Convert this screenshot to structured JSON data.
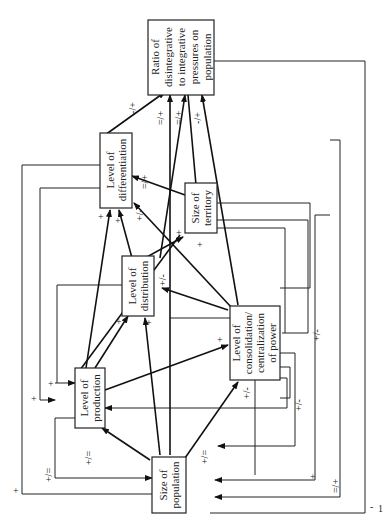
{
  "nodes": {
    "ratio": {
      "lines": [
        "Ratio of",
        "disintegrative",
        "to integrative",
        "pressures on",
        "population"
      ]
    },
    "differentiation": {
      "lines": [
        "Level of",
        "differentiation"
      ]
    },
    "territory": {
      "lines": [
        "Size of",
        "territory"
      ]
    },
    "distribution": {
      "lines": [
        "Level of",
        "distribution"
      ]
    },
    "consolidation": {
      "lines": [
        "Level of",
        "consolidation/",
        "centralization",
        "of power"
      ]
    },
    "production": {
      "lines": [
        "Level of",
        "production"
      ]
    },
    "population": {
      "lines": [
        "Size of",
        "population"
      ]
    }
  },
  "edge_labels": {
    "diff_to_ratio": "-/+",
    "pop_to_ratio_a": "=/+",
    "dist_to_ratio": "=/+",
    "terr_to_ratio": "-/+",
    "terr_to_diff": "=/+",
    "cons_to_diff": "+/-",
    "prod_to_diff": "+",
    "dist_to_diff": "+",
    "prod_to_terr": "+",
    "dist_to_terr": "+",
    "cons_to_dist": "+/-",
    "prod_to_dist": "+",
    "pop_to_dist": "+",
    "prod_to_cons": "+",
    "pop_to_cons": "+/-",
    "terr_loop_cons": "+/-",
    "pop_to_prod": "+/=",
    "dist_loop_prod": "+",
    "diff_loop_prod": "+",
    "cons_loop_prod": "+/-",
    "prod_loop_pop": "+/=",
    "outer_left_loop": "+",
    "cons_loop_pop": "+/=",
    "right_loop_1": "+",
    "right_loop_2": "=/+",
    "ratio_loop": "-"
  },
  "page_number": "1"
}
